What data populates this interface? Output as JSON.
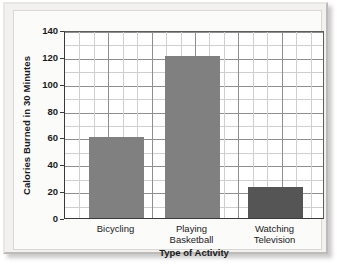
{
  "chart_data": {
    "type": "bar",
    "title": "",
    "categories": [
      "Bicycling",
      "Playing Basketball",
      "Watching Television"
    ],
    "category_lines": [
      [
        "Bicycling"
      ],
      [
        "Playing",
        "Basketball"
      ],
      [
        "Watching",
        "Television"
      ]
    ],
    "values": [
      60,
      121,
      23
    ],
    "xlabel": "Type of Activity",
    "ylabel": "Calories Burned in 30 Minutes",
    "ylim": [
      0,
      140
    ],
    "ytick_labels": [
      "0",
      "20",
      "40",
      "60",
      "80",
      "100",
      "120",
      "140"
    ],
    "ytick_values": [
      0,
      20,
      40,
      60,
      80,
      100,
      120,
      140
    ],
    "y_minor_step": 10,
    "grid": true,
    "grid_horizontal_rows": 14,
    "grid_vertical_columns": 18,
    "legend": null,
    "bar_colors": [
      "#808080",
      "#808080",
      "#555555"
    ],
    "grid_minor_color": "#cfcfcf",
    "grid_major_color": "#8e8e8e",
    "axis_color": "#3a3a3a",
    "plot_background": "#ffffff",
    "figure_background": "#f2f1ef"
  }
}
